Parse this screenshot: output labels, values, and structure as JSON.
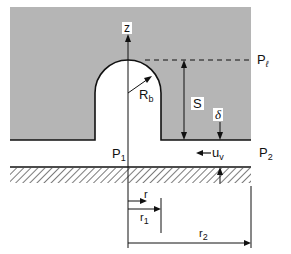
{
  "diagram": {
    "colors": {
      "liquid_fill": "#b5b5b5",
      "bubble_fill": "#ffffff",
      "line": "#111111",
      "background": "#ffffff"
    },
    "labels": {
      "z_axis": "z",
      "bubble_radius": "R",
      "bubble_radius_sub": "b",
      "liquid_pressure": "P",
      "liquid_pressure_sub": "ℓ",
      "height": "S",
      "film_thickness": "δ",
      "inner_pressure": "P",
      "inner_pressure_sub": "1",
      "outer_pressure": "P",
      "outer_pressure_sub": "2",
      "vapor_velocity": "u",
      "vapor_velocity_sub": "v",
      "radius_r": "r",
      "radius_r1": "r",
      "radius_r1_sub": "1",
      "radius_r2": "r",
      "radius_r2_sub": "2"
    }
  }
}
